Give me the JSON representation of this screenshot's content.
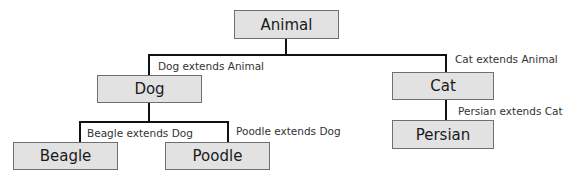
{
  "diagram": {
    "type": "class-inheritance-tree",
    "nodes": {
      "animal": "Animal",
      "dog": "Dog",
      "cat": "Cat",
      "beagle": "Beagle",
      "poodle": "Poodle",
      "persian": "Persian"
    },
    "edges": {
      "dog_animal": "Dog extends Animal",
      "cat_animal": "Cat extends Animal",
      "beagle_dog": "Beagle extends Dog",
      "poodle_dog": "Poodle extends Dog",
      "persian_cat": "Persian extends Cat"
    },
    "colors": {
      "box_fill": "#e2e2e2",
      "box_border": "#6f6f6f",
      "connector": "#111111",
      "label_text": "#333333"
    }
  }
}
